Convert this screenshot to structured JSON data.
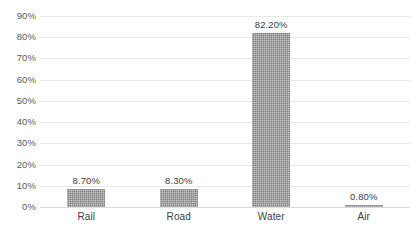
{
  "chart_data": {
    "type": "bar",
    "title": "",
    "subtitle": "",
    "xlabel": "",
    "ylabel": "",
    "categories": [
      "Rail",
      "Road",
      "Water",
      "Air"
    ],
    "values": [
      8.7,
      8.3,
      82.2,
      0.8
    ],
    "data_labels": [
      "8.70%",
      "8.30%",
      "82.20%",
      "0.80%"
    ],
    "ylim": [
      0,
      90
    ],
    "y_ticks": [
      0,
      10,
      20,
      30,
      40,
      50,
      60,
      70,
      80,
      90
    ],
    "y_tick_labels": [
      "0%",
      "10%",
      "20%",
      "30%",
      "40%",
      "50%",
      "60%",
      "70%",
      "80%",
      "90%"
    ],
    "grid": true,
    "legend": false,
    "legend_position": "none",
    "series": [
      {
        "name": "",
        "values": [
          8.7,
          8.3,
          82.2,
          0.8
        ]
      }
    ],
    "colors": {
      "bar_fill": "#7f7f7f",
      "gridline": "#e8e8e8",
      "baseline": "#d9d9d9",
      "tick_label": "#5a5a5a",
      "data_label": "#404040",
      "background": "#ffffff"
    }
  }
}
